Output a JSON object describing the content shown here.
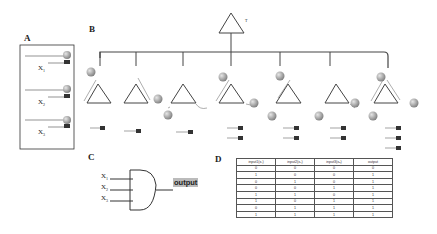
{
  "panels": {
    "a": {
      "label": "A",
      "inputs": [
        {
          "name": "X",
          "sub": "1"
        },
        {
          "name": "X",
          "sub": "2"
        },
        {
          "name": "X",
          "sub": "3"
        }
      ]
    },
    "b": {
      "label": "B",
      "top_gate_label": "T",
      "gate_count": 7
    },
    "c": {
      "label": "C",
      "inputs": [
        {
          "name": "X",
          "sub": "1"
        },
        {
          "name": "X",
          "sub": "2"
        },
        {
          "name": "X",
          "sub": "3"
        }
      ],
      "output_label": "output"
    },
    "d": {
      "label": "D",
      "table": {
        "headers": [
          "input1(x₁)",
          "input2(x₂)",
          "input3(x₃)",
          "output"
        ],
        "rows": [
          [
            "0",
            "0",
            "0",
            "0"
          ],
          [
            "1",
            "0",
            "0",
            "1"
          ],
          [
            "0",
            "1",
            "0",
            "1"
          ],
          [
            "0",
            "0",
            "1",
            "1"
          ],
          [
            "1",
            "1",
            "0",
            "1"
          ],
          [
            "1",
            "0",
            "1",
            "1"
          ],
          [
            "0",
            "1",
            "1",
            "1"
          ],
          [
            "1",
            "1",
            "1",
            "1"
          ]
        ]
      }
    }
  },
  "colors": {
    "line": "#444444",
    "sphere": "#9a9a9a",
    "highlight": "#bbbbbb"
  }
}
